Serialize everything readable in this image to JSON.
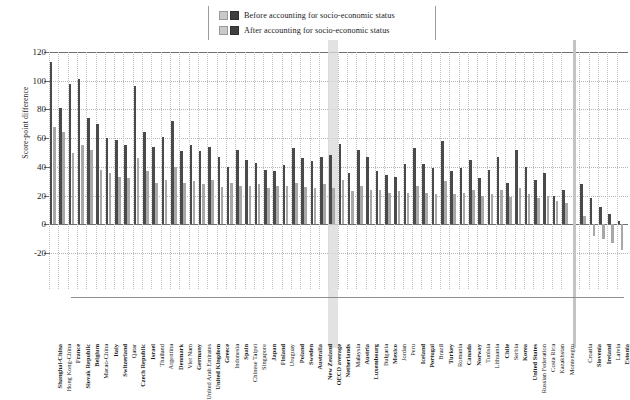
{
  "legend": {
    "items": [
      {
        "label": "Before accounting for socio-economic status",
        "color": "#3f3f3f",
        "swatch2": "#c9c9c9"
      },
      {
        "label": "After accounting for socio-economic status",
        "color": "#a8a8a8",
        "swatch2": "#c9c9c9"
      }
    ]
  },
  "chart_data": {
    "type": "bar",
    "title": "",
    "xlabel": "",
    "ylabel": "Score-point difference",
    "ylim": [
      -20,
      120
    ],
    "yticks": [
      -20,
      0,
      20,
      40,
      60,
      80,
      100,
      120
    ],
    "ytick_labels": [
      "-20",
      "0",
      "20",
      "40",
      "60",
      "80",
      "100",
      "120"
    ],
    "grid": true,
    "legend_position": "top-center",
    "highlight_category": "OECD average",
    "categories": [
      "Shanghai-China",
      "Hong Kong-China",
      "France",
      "Slovak Republic",
      "Belgium",
      "Macao-China",
      "Italy",
      "Switzerland",
      "Qatar",
      "Czech Republic",
      "Israel",
      "Thailand",
      "Argentina",
      "Denmark",
      "Viet Nam",
      "Germany",
      "United Arab Emirates",
      "United Kingdom",
      "Greece",
      "Indonesia",
      "Spain",
      "Chinese Taipei",
      "Singapore",
      "Japan",
      "Finland",
      "Uruguay",
      "Poland",
      "Sweden",
      "Australia",
      "New Zealand",
      "OECD average",
      "Netherlands",
      "Malaysia",
      "Austria",
      "Luxembourg",
      "Bulgaria",
      "Mexico",
      "Jordan",
      "Peru",
      "Iceland",
      "Portugal",
      "Brazil",
      "Turkey",
      "Romania",
      "Canada",
      "Norway",
      "Tunisia",
      "Lithuania",
      "Chile",
      "Serbia",
      "Korea",
      "United States",
      "Russian Federation",
      "Costa Rica",
      "Kazakhstan",
      "Montenegro",
      "Croatia",
      "Slovenia",
      "Ireland",
      "Latvia",
      "Estonia"
    ],
    "bold_categories": [
      "Shanghai-China",
      "France",
      "Slovak Republic",
      "Belgium",
      "Italy",
      "Switzerland",
      "Czech Republic",
      "Israel",
      "Denmark",
      "Germany",
      "United Kingdom",
      "Greece",
      "Spain",
      "Japan",
      "Finland",
      "Poland",
      "Sweden",
      "Australia",
      "New Zealand",
      "OECD average",
      "Netherlands",
      "Austria",
      "Luxembourg",
      "Mexico",
      "Iceland",
      "Portugal",
      "Turkey",
      "Canada",
      "Norway",
      "Chile",
      "Korea",
      "United States",
      "Slovenia",
      "Ireland",
      "Estonia"
    ],
    "series": [
      {
        "name": "Before accounting for socio-economic status",
        "color": "#4a4a4a",
        "values": [
          113,
          81,
          98,
          101,
          74,
          70,
          60,
          59,
          55,
          96,
          64,
          54,
          61,
          72,
          51,
          55,
          51,
          54,
          47,
          40,
          52,
          45,
          43,
          38,
          37,
          41,
          53,
          46,
          44,
          47,
          48,
          56,
          36,
          52,
          47,
          37,
          34,
          33,
          42,
          53,
          42,
          39,
          58,
          37,
          39,
          45,
          32,
          38,
          47,
          29,
          52,
          40,
          31,
          36,
          20,
          24,
          28,
          18,
          12,
          7,
          2
        ]
      },
      {
        "name": "After accounting for socio-economic status",
        "color": "#a8a8a8",
        "values": [
          68,
          64,
          50,
          55,
          52,
          38,
          36,
          33,
          32,
          46,
          37,
          29,
          31,
          40,
          29,
          30,
          28,
          31,
          26,
          29,
          27,
          27,
          28,
          25,
          27,
          27,
          29,
          26,
          25,
          28,
          25,
          31,
          23,
          27,
          24,
          24,
          22,
          23,
          22,
          27,
          22,
          21,
          30,
          21,
          22,
          24,
          20,
          21,
          24,
          19,
          25,
          21,
          18,
          20,
          16,
          15,
          6,
          -8,
          -10,
          -13,
          -18
        ]
      }
    ]
  }
}
